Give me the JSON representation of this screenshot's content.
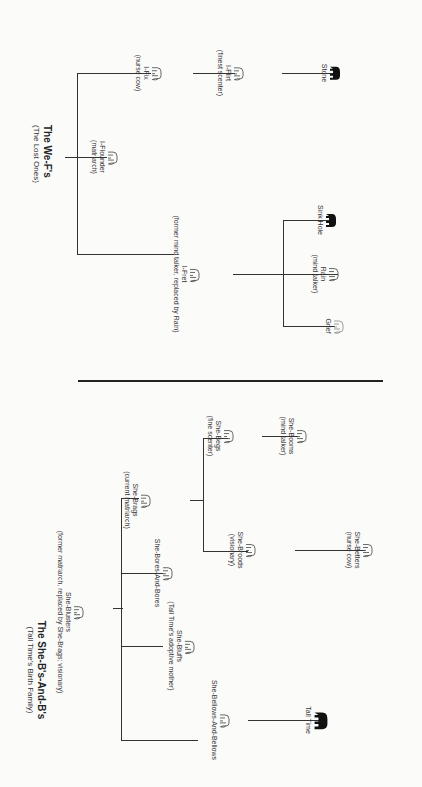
{
  "diagram": {
    "type": "family-tree",
    "orientation": "rotated 90 degrees clockwise"
  },
  "we_fs": {
    "title": "The We-F's",
    "subtitle": "(The Lost Ones)",
    "nodes": {
      "matriarch": {
        "name": "I-Flounder",
        "desc": "(matriarch)",
        "icon": "elephant-outline-icon"
      },
      "fret": {
        "name": "I-Fret",
        "desc": "(former mind talker, replaced by Rain)",
        "icon": "elephant-outline-icon"
      },
      "fix": {
        "name": "I-Fix",
        "desc": "(nurse cow)",
        "icon": "elephant-outline-icon"
      },
      "flirt": {
        "name": "I-Flirt",
        "desc": "(finest scenter)",
        "icon": "elephant-outline-icon"
      },
      "stone": {
        "name": "Stone",
        "desc": "",
        "icon": "elephant-solid-icon"
      },
      "grief": {
        "name": "Grief",
        "desc": "",
        "icon": "elephant-outline-icon"
      },
      "rain": {
        "name": "Rain",
        "desc": "(mind talker)",
        "icon": "elephant-outline-icon"
      },
      "sinkhole": {
        "name": "Sink Hole",
        "desc": "",
        "icon": "elephant-solid-icon"
      }
    }
  },
  "she_bs": {
    "title": "The She-B's-And-B's",
    "subtitle": "(Tall Time's Birth Family)",
    "nodes": {
      "blusters": {
        "name": "She-Blusters",
        "desc": "(former matriarch, replaced by She-Brags; visionary)",
        "icon": "elephant-outline-icon"
      },
      "bellows": {
        "name": "She-Bellows-And-Bellows",
        "desc": "",
        "icon": "elephant-outline-icon"
      },
      "bluffs": {
        "name": "She-Bluffs",
        "desc": "(Tall Time's adoptive mother)",
        "icon": "elephant-outline-icon"
      },
      "bores": {
        "name": "She-Bores-And-Bores",
        "desc": "",
        "icon": "elephant-outline-icon"
      },
      "brags": {
        "name": "She-Brags",
        "desc": "(current matriarch)",
        "icon": "elephant-outline-icon"
      },
      "broods": {
        "name": "She-Broods",
        "desc": "(visionary)",
        "icon": "elephant-outline-icon"
      },
      "begs": {
        "name": "She-Begs",
        "desc": "(fine scenter)",
        "icon": "elephant-outline-icon"
      },
      "betters": {
        "name": "She-Betters",
        "desc": "(nurse cow)",
        "icon": "elephant-outline-icon"
      },
      "booms": {
        "name": "She-Booms",
        "desc": "(mind talker)",
        "icon": "elephant-outline-icon"
      },
      "talltime": {
        "name": "Tall Time",
        "desc": "",
        "icon": "elephant-solid-icon"
      }
    }
  }
}
